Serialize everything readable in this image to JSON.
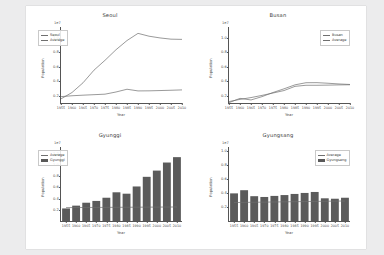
{
  "figure": {
    "background": "#ffffff",
    "page_background": "#ececed",
    "line_color": "#6f6f6f",
    "bar_color": "#5b5b5b"
  },
  "common": {
    "xlabel": "Year",
    "ylabel": "Population",
    "exponent": "1e7",
    "xticks": [
      "1955",
      "1960",
      "1965",
      "1970",
      "1975",
      "1980",
      "1985",
      "1990",
      "1995",
      "2000",
      "2005",
      "2010"
    ]
  },
  "panels": [
    {
      "key": "seoul",
      "title": "Seoul",
      "legend": [
        "Seoul",
        "Average"
      ],
      "yticks": [
        "0.2",
        "0.4",
        "0.6",
        "0.8",
        "1.0"
      ]
    },
    {
      "key": "busan",
      "title": "Busan",
      "legend": [
        "Busan",
        "Average"
      ],
      "yticks": [
        "0.2",
        "0.4",
        "0.6",
        "0.8",
        "1.0"
      ]
    },
    {
      "key": "gyunggi",
      "title": "Gyunggi",
      "legend": [
        "Average",
        "Gyunggi"
      ],
      "yticks": [
        "0.2",
        "0.4",
        "0.6",
        "0.8",
        "1.0",
        "1.2"
      ]
    },
    {
      "key": "gyungsang",
      "title": "Gyungsang",
      "legend": [
        "Average",
        "Gyungsang"
      ],
      "yticks": [
        "0.2",
        "0.4",
        "0.6",
        "0.8",
        "1.0"
      ]
    }
  ],
  "chart_data": [
    {
      "type": "line",
      "title": "Seoul",
      "xlabel": "Year",
      "ylabel": "Population",
      "yscale_exponent": "1e7",
      "grid": false,
      "legend_position": "upper left",
      "x": [
        1955,
        1960,
        1965,
        1970,
        1975,
        1980,
        1985,
        1990,
        1995,
        2000,
        2005,
        2010
      ],
      "ylim": [
        0.1,
        1.15
      ],
      "series": [
        {
          "name": "Seoul",
          "values": [
            0.157,
            0.245,
            0.379,
            0.554,
            0.69,
            0.836,
            0.963,
            1.062,
            1.023,
            0.999,
            0.982,
            0.979
          ]
        },
        {
          "name": "Average",
          "values": [
            0.188,
            0.2,
            0.208,
            0.215,
            0.222,
            0.252,
            0.29,
            0.267,
            0.268,
            0.272,
            0.276,
            0.281
          ]
        }
      ]
    },
    {
      "type": "line",
      "title": "Busan",
      "xlabel": "Year",
      "ylabel": "Population",
      "yscale_exponent": "1e7",
      "grid": false,
      "legend_position": "upper right",
      "x": [
        1955,
        1960,
        1965,
        1970,
        1975,
        1980,
        1985,
        1990,
        1995,
        2000,
        2005,
        2010
      ],
      "ylim": [
        0.1,
        1.15
      ],
      "series": [
        {
          "name": "Busan",
          "values": [
            0.105,
            0.164,
            0.142,
            0.188,
            0.245,
            0.296,
            0.351,
            0.38,
            0.381,
            0.373,
            0.363,
            0.356
          ]
        },
        {
          "name": "Average",
          "values": [
            0.12,
            0.15,
            0.175,
            0.205,
            0.238,
            0.272,
            0.33,
            0.345,
            0.345,
            0.347,
            0.35,
            0.352
          ]
        }
      ]
    },
    {
      "type": "bar",
      "title": "Gyunggi",
      "xlabel": "Year",
      "ylabel": "Population",
      "yscale_exponent": "1e7",
      "grid": false,
      "legend_position": "upper left",
      "categories": [
        "1955",
        "1960",
        "1965",
        "1970",
        "1975",
        "1980",
        "1985",
        "1990",
        "1995",
        "2000",
        "2005",
        "2010"
      ],
      "ylim": [
        0,
        1.32
      ],
      "values": [
        0.224,
        0.274,
        0.326,
        0.358,
        0.415,
        0.512,
        0.487,
        0.616,
        0.788,
        0.899,
        1.043,
        1.139
      ],
      "series": [
        {
          "name": "Gyunggi",
          "type": "bar",
          "values": [
            0.224,
            0.274,
            0.326,
            0.358,
            0.415,
            0.512,
            0.487,
            0.616,
            0.788,
            0.899,
            1.043,
            1.139
          ]
        },
        {
          "name": "Average",
          "type": "line",
          "values": [
            0.239,
            0.24,
            0.241,
            0.242,
            0.243,
            0.244,
            0.245,
            0.246,
            0.247,
            0.248,
            0.249,
            0.25
          ]
        }
      ]
    },
    {
      "type": "bar",
      "title": "Gyungsang",
      "xlabel": "Year",
      "ylabel": "Population",
      "yscale_exponent": "1e7",
      "grid": false,
      "legend_position": "upper right",
      "categories": [
        "1955",
        "1960",
        "1965",
        "1970",
        "1975",
        "1980",
        "1985",
        "1990",
        "1995",
        "2000",
        "2005",
        "2010"
      ],
      "ylim": [
        0,
        1.05
      ],
      "values": [
        0.392,
        0.437,
        0.352,
        0.341,
        0.356,
        0.368,
        0.384,
        0.398,
        0.412,
        0.322,
        0.316,
        0.33
      ],
      "series": [
        {
          "name": "Gyungsang",
          "type": "bar",
          "values": [
            0.392,
            0.437,
            0.352,
            0.341,
            0.356,
            0.368,
            0.384,
            0.398,
            0.412,
            0.322,
            0.316,
            0.33
          ]
        },
        {
          "name": "Average",
          "type": "line",
          "values": [
            0.262,
            0.264,
            0.266,
            0.268,
            0.27,
            0.272,
            0.274,
            0.276,
            0.278,
            0.28,
            0.282,
            0.284
          ]
        }
      ]
    }
  ]
}
